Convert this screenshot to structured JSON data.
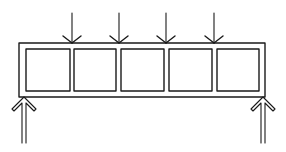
{
  "diagram": {
    "stroke_color": "#1a1a1a",
    "background_color": "#ffffff",
    "frame": {
      "x1": 19,
      "y1": 43,
      "x2": 265,
      "y2": 97
    },
    "panels": [
      {
        "x1": 26,
        "y1": 49,
        "x2": 70,
        "y2": 91
      },
      {
        "x1": 74,
        "y1": 49,
        "x2": 116,
        "y2": 91
      },
      {
        "x1": 121,
        "y1": 49,
        "x2": 164,
        "y2": 91
      },
      {
        "x1": 169,
        "y1": 49,
        "x2": 212,
        "y2": 91
      },
      {
        "x1": 217,
        "y1": 49,
        "x2": 259,
        "y2": 91
      }
    ],
    "load_arrows_down": [
      {
        "x": 72,
        "y_top": 13,
        "y_tip": 43
      },
      {
        "x": 119,
        "y_top": 13,
        "y_tip": 43
      },
      {
        "x": 166,
        "y_top": 13,
        "y_tip": 43
      },
      {
        "x": 214,
        "y_top": 13,
        "y_tip": 43
      }
    ],
    "support_arrows_up": [
      {
        "x": 24,
        "y_tip": 97,
        "y_bottom": 143
      },
      {
        "x": 263,
        "y_tip": 97,
        "y_bottom": 143
      }
    ]
  }
}
